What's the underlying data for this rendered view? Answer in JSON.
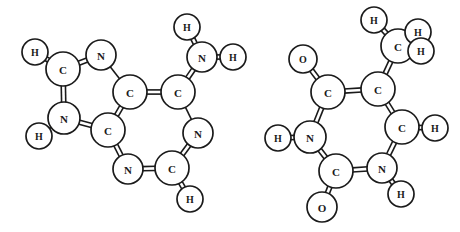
{
  "figure": {
    "background_color": "#ffffff",
    "line_color": "#1a1a1a",
    "atom_fill_color": "#ffffff",
    "width": 460,
    "height": 232
  },
  "molecules": [
    {
      "id": "molecule-left",
      "name": "adenine",
      "atoms": [
        {
          "id": "L-H1",
          "label": "H",
          "x": 35,
          "y": 52,
          "r": 13
        },
        {
          "id": "L-C2",
          "label": "C",
          "x": 63,
          "y": 69,
          "r": 17
        },
        {
          "id": "L-N3",
          "label": "N",
          "x": 101,
          "y": 55,
          "r": 15
        },
        {
          "id": "L-N4",
          "label": "N",
          "x": 64,
          "y": 118,
          "r": 16
        },
        {
          "id": "L-H5",
          "label": "H",
          "x": 39,
          "y": 136,
          "r": 13
        },
        {
          "id": "L-C6",
          "label": "C",
          "x": 108,
          "y": 130,
          "r": 17
        },
        {
          "id": "L-C7",
          "label": "C",
          "x": 130,
          "y": 92,
          "r": 17
        },
        {
          "id": "L-C8",
          "label": "C",
          "x": 178,
          "y": 92,
          "r": 17
        },
        {
          "id": "L-N9",
          "label": "N",
          "x": 202,
          "y": 57,
          "r": 15
        },
        {
          "id": "L-H10",
          "label": "H",
          "x": 187,
          "y": 27,
          "r": 13
        },
        {
          "id": "L-H11",
          "label": "H",
          "x": 233,
          "y": 57,
          "r": 13
        },
        {
          "id": "L-N12",
          "label": "N",
          "x": 198,
          "y": 133,
          "r": 15
        },
        {
          "id": "L-C13",
          "label": "C",
          "x": 172,
          "y": 168,
          "r": 17
        },
        {
          "id": "L-H14",
          "label": "H",
          "x": 190,
          "y": 199,
          "r": 13
        },
        {
          "id": "L-N15",
          "label": "N",
          "x": 128,
          "y": 169,
          "r": 15
        }
      ],
      "bonds": [
        {
          "from": "L-H1",
          "to": "L-C2",
          "order": 2
        },
        {
          "from": "L-C2",
          "to": "L-N3",
          "order": 2
        },
        {
          "from": "L-C2",
          "to": "L-N4",
          "order": 2
        },
        {
          "from": "L-N3",
          "to": "L-C7",
          "order": 1
        },
        {
          "from": "L-N4",
          "to": "L-H5",
          "order": 1
        },
        {
          "from": "L-N4",
          "to": "L-C6",
          "order": 2
        },
        {
          "from": "L-C6",
          "to": "L-C7",
          "order": 2
        },
        {
          "from": "L-C7",
          "to": "L-C8",
          "order": 2
        },
        {
          "from": "L-C8",
          "to": "L-N9",
          "order": 2
        },
        {
          "from": "L-N9",
          "to": "L-H10",
          "order": 2
        },
        {
          "from": "L-N9",
          "to": "L-H11",
          "order": 2
        },
        {
          "from": "L-C8",
          "to": "L-N12",
          "order": 1
        },
        {
          "from": "L-N12",
          "to": "L-C13",
          "order": 2
        },
        {
          "from": "L-C13",
          "to": "L-H14",
          "order": 2
        },
        {
          "from": "L-C13",
          "to": "L-N15",
          "order": 2
        },
        {
          "from": "L-N15",
          "to": "L-C6",
          "order": 2
        }
      ]
    },
    {
      "id": "molecule-right",
      "name": "thymine",
      "atoms": [
        {
          "id": "R-H1",
          "label": "H",
          "x": 374,
          "y": 20,
          "r": 13
        },
        {
          "id": "R-C2",
          "label": "C",
          "x": 398,
          "y": 46,
          "r": 17
        },
        {
          "id": "R-H3",
          "label": "H",
          "x": 418,
          "y": 32,
          "r": 13
        },
        {
          "id": "R-H4",
          "label": "H",
          "x": 421,
          "y": 51,
          "r": 13
        },
        {
          "id": "R-O5",
          "label": "O",
          "x": 303,
          "y": 59,
          "r": 14
        },
        {
          "id": "R-C6",
          "label": "C",
          "x": 328,
          "y": 92,
          "r": 17
        },
        {
          "id": "R-C7",
          "label": "C",
          "x": 378,
          "y": 89,
          "r": 17
        },
        {
          "id": "R-C8",
          "label": "C",
          "x": 402,
          "y": 127,
          "r": 17
        },
        {
          "id": "R-H9",
          "label": "H",
          "x": 435,
          "y": 128,
          "r": 13
        },
        {
          "id": "R-N10",
          "label": "N",
          "x": 310,
          "y": 137,
          "r": 16
        },
        {
          "id": "R-H11",
          "label": "H",
          "x": 278,
          "y": 138,
          "r": 13
        },
        {
          "id": "R-N12",
          "label": "N",
          "x": 382,
          "y": 168,
          "r": 15
        },
        {
          "id": "R-H13",
          "label": "H",
          "x": 401,
          "y": 194,
          "r": 13
        },
        {
          "id": "R-C14",
          "label": "C",
          "x": 336,
          "y": 171,
          "r": 17
        },
        {
          "id": "R-O15",
          "label": "O",
          "x": 322,
          "y": 207,
          "r": 15
        }
      ],
      "bonds": [
        {
          "from": "R-H1",
          "to": "R-C2",
          "order": 2
        },
        {
          "from": "R-C2",
          "to": "R-H3",
          "order": 1
        },
        {
          "from": "R-C2",
          "to": "R-H4",
          "order": 1
        },
        {
          "from": "R-C2",
          "to": "R-C7",
          "order": 2
        },
        {
          "from": "R-O5",
          "to": "R-C6",
          "order": 2
        },
        {
          "from": "R-C6",
          "to": "R-C7",
          "order": 2
        },
        {
          "from": "R-C6",
          "to": "R-N10",
          "order": 2
        },
        {
          "from": "R-C7",
          "to": "R-C8",
          "order": 2
        },
        {
          "from": "R-C8",
          "to": "R-H9",
          "order": 2
        },
        {
          "from": "R-C8",
          "to": "R-N12",
          "order": 2
        },
        {
          "from": "R-N10",
          "to": "R-H11",
          "order": 2
        },
        {
          "from": "R-N10",
          "to": "R-C14",
          "order": 2
        },
        {
          "from": "R-C14",
          "to": "R-N12",
          "order": 2
        },
        {
          "from": "R-C14",
          "to": "R-O15",
          "order": 2
        },
        {
          "from": "R-N12",
          "to": "R-H13",
          "order": 2
        }
      ],
      "wedges": [
        {
          "from": "R-C2",
          "to": "R-H4"
        }
      ]
    }
  ]
}
